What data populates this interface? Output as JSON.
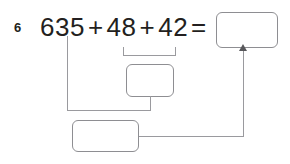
{
  "problem": {
    "number": "6",
    "expression": {
      "term1": "635",
      "operator1": "+",
      "term2": "48",
      "operator2": "+",
      "term3": "42",
      "equals": "="
    }
  },
  "boxes": {
    "answer_box": {
      "value": "",
      "placeholder": ""
    },
    "middle_box": {
      "value": "",
      "placeholder": ""
    },
    "bottom_box": {
      "value": "",
      "placeholder": ""
    }
  },
  "colors": {
    "text": "#231f20",
    "box_border": "#8e8e92",
    "connector": "#9a9a9e",
    "arrow": "#58585b",
    "background": "#ffffff"
  }
}
